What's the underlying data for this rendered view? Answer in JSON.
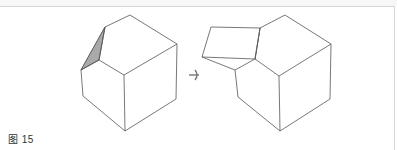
{
  "figure": {
    "caption": "图 15",
    "line_color": "#555555",
    "shade_color": "#a9a9a9",
    "arrow_color": "#777777",
    "border_color": "#d6d6d6"
  },
  "left_solid": {
    "label": "cube with cut corner (shaded triangular face)",
    "outline": [
      [
        130,
        15
      ],
      [
        177,
        44
      ],
      [
        176,
        99
      ],
      [
        125,
        131
      ],
      [
        83,
        96
      ],
      [
        81,
        70
      ],
      [
        105,
        27
      ]
    ],
    "edges": [
      [
        [
          105,
          27
        ],
        [
          99,
          60
        ]
      ],
      [
        [
          99,
          60
        ],
        [
          81,
          70
        ]
      ],
      [
        [
          99,
          60
        ],
        [
          124,
          75
        ]
      ],
      [
        [
          124,
          75
        ],
        [
          177,
          44
        ]
      ],
      [
        [
          124,
          75
        ],
        [
          125,
          131
        ]
      ]
    ],
    "shaded_face": [
      [
        105,
        27
      ],
      [
        99,
        60
      ],
      [
        81,
        70
      ]
    ]
  },
  "arrow": {
    "direction": "right",
    "position": [
      195,
      75
    ]
  },
  "right_solid": {
    "label": "cube with corner flap unfolded",
    "outline": [
      [
        285,
        15
      ],
      [
        331,
        44
      ],
      [
        330,
        99
      ],
      [
        280,
        131
      ],
      [
        238,
        97
      ],
      [
        235,
        70
      ],
      [
        255,
        59
      ],
      [
        260,
        28
      ]
    ],
    "edges": [
      [
        [
          255,
          59
        ],
        [
          279,
          76
        ]
      ],
      [
        [
          279,
          76
        ],
        [
          331,
          44
        ]
      ],
      [
        [
          279,
          76
        ],
        [
          280,
          131
        ]
      ],
      [
        [
          255,
          59
        ],
        [
          260,
          28
        ]
      ]
    ],
    "flap": [
      [
        260,
        28
      ],
      [
        211,
        27
      ],
      [
        202,
        57
      ],
      [
        255,
        59
      ]
    ],
    "flap_edges": [
      [
        [
          202,
          57
        ],
        [
          235,
          70
        ]
      ]
    ]
  }
}
